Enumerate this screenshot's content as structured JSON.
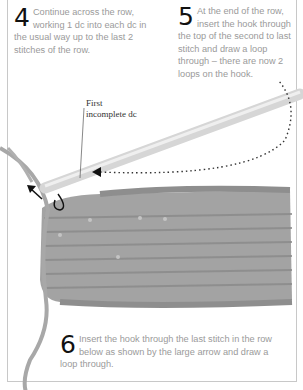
{
  "steps": [
    {
      "number": "4",
      "text": "Continue across the row, working 1 dc into each dc in the usual way up to the last 2 stitches of the row."
    },
    {
      "number": "5",
      "text": "At the end of the row, insert the hook through the top of the second to last stitch and draw a loop through – there are now 2 loops on the hook."
    },
    {
      "number": "6",
      "text": "Insert the hook through the last stitch in the row below as shown by the large arrow and draw a loop through."
    }
  ],
  "annotation": {
    "label_line1": "First",
    "label_line2": "incomplete dc"
  },
  "illustration": {
    "subject": "crochet-swatch-with-hook",
    "yarn_color": "#9c9c9c",
    "hook_color": "#dcdcdc",
    "arrow_color": "#111111"
  }
}
